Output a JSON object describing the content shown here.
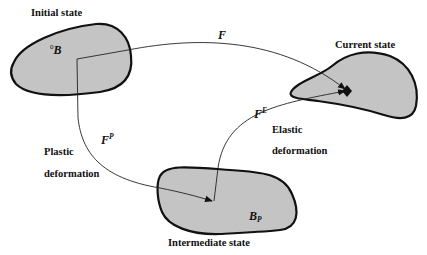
{
  "diagram": {
    "states": {
      "initial": {
        "label": "Initial state",
        "body_symbol": "B",
        "body_prefix_superscript": "0"
      },
      "current": {
        "label": "Current state"
      },
      "intermediate": {
        "label": "Intermediate state",
        "body_symbol": "B",
        "body_subscript": "P"
      }
    },
    "maps": {
      "total": {
        "symbol": "F"
      },
      "plastic": {
        "symbol": "F",
        "superscript": "P",
        "description_line1": "Plastic",
        "description_line2": "deformation"
      },
      "elastic": {
        "symbol": "F",
        "superscript": "E",
        "description_line1": "Elastic",
        "description_line2": "deformation"
      }
    },
    "colors": {
      "body_fill": "#c4c4c4",
      "outline": "#111111",
      "background": "#ffffff"
    }
  }
}
